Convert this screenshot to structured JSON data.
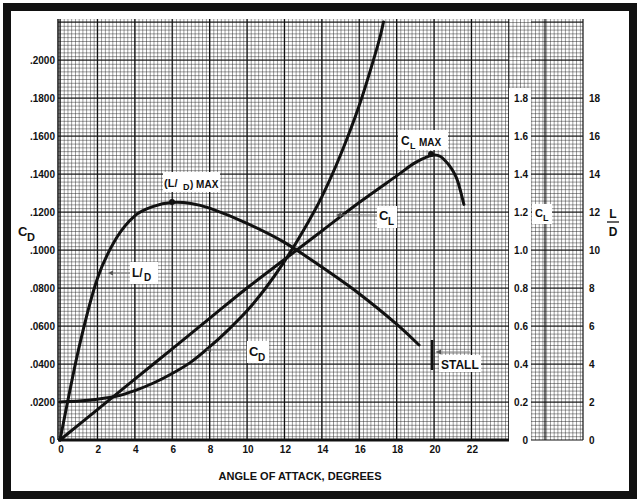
{
  "chart_data": {
    "type": "line",
    "title": "",
    "xlabel": "ANGLE OF ATTACK, DEGREES",
    "x_ticks": [
      "0",
      "2",
      "4",
      "6",
      "8",
      "10",
      "12",
      "14",
      "16",
      "18",
      "20",
      "22"
    ],
    "xlim": [
      0,
      24
    ],
    "grid": true,
    "axes": [
      {
        "id": "CD",
        "label": "C_D",
        "position": "left",
        "range": [
          0,
          0.22
        ],
        "ticks": [
          "0",
          ".0200",
          ".0400",
          ".0600",
          ".0800",
          ".1000",
          ".1200",
          ".1400",
          ".1600",
          ".1800",
          ".2000"
        ]
      },
      {
        "id": "CL",
        "label": "C_L",
        "position": "right-inner",
        "range": [
          0,
          1.8
        ],
        "ticks": [
          "0",
          "0.2",
          "0.4",
          "0.6",
          "0.8",
          "1.0",
          "1.2",
          "1.4",
          "1.6",
          "1.8"
        ]
      },
      {
        "id": "LD",
        "label": "L/D",
        "position": "right-outer",
        "range": [
          0,
          18
        ],
        "ticks": [
          "0",
          "2",
          "4",
          "6",
          "8",
          "10",
          "12",
          "14",
          "16",
          "18"
        ]
      }
    ],
    "series": [
      {
        "name": "C_L",
        "axis": "CL",
        "x": [
          0,
          2,
          4,
          6,
          8,
          10,
          12,
          14,
          16,
          18,
          19,
          20,
          20.6,
          21.2,
          21.6
        ],
        "values": [
          0,
          0.16,
          0.32,
          0.48,
          0.64,
          0.8,
          0.95,
          1.1,
          1.25,
          1.39,
          1.46,
          1.5,
          1.47,
          1.38,
          1.24
        ]
      },
      {
        "name": "L/D",
        "axis": "LD",
        "x": [
          0,
          1,
          2,
          3,
          4,
          5,
          6,
          7,
          8,
          10,
          12,
          14,
          16,
          18,
          19.2
        ],
        "values": [
          0,
          4.8,
          8.5,
          10.6,
          11.8,
          12.3,
          12.5,
          12.45,
          12.2,
          11.4,
          10.4,
          9.1,
          7.7,
          6.1,
          5.0
        ]
      },
      {
        "name": "C_D",
        "axis": "CD",
        "x": [
          0,
          1,
          2,
          3,
          4,
          5,
          6,
          7,
          8,
          9,
          10,
          11,
          12,
          13,
          14,
          15,
          16,
          17,
          17.3
        ],
        "values": [
          0.02,
          0.0205,
          0.0215,
          0.023,
          0.026,
          0.03,
          0.035,
          0.041,
          0.049,
          0.058,
          0.068,
          0.08,
          0.094,
          0.11,
          0.128,
          0.15,
          0.176,
          0.208,
          0.22
        ]
      }
    ],
    "annotations": [
      {
        "text": "(L/D) MAX",
        "x": 6,
        "value_LD": 12.5
      },
      {
        "text": "C_L MAX",
        "x": 20,
        "value_CL": 1.5
      },
      {
        "text": "STALL",
        "x": 19.8
      },
      {
        "text": "L/D",
        "points_to": "L/D curve"
      },
      {
        "text": "C_L",
        "points_to": "C_L curve"
      },
      {
        "text": "C_D",
        "points_to": "C_D curve"
      }
    ]
  },
  "labels": {
    "xlabel": "ANGLE OF ATTACK, DEGREES",
    "cd_axis": "C",
    "cd_sub": "D",
    "cl_axis": "C",
    "cl_sub": "L",
    "ld_num": "L",
    "ld_den": "D",
    "ld_max_open": "(L/",
    "ld_max_sub": "D",
    "ld_max_close": ") MAX",
    "cl_max_main": "C",
    "cl_max_sub": "L",
    "cl_max_word": "MAX",
    "stall": "STALL",
    "ld_tag_main": "L/",
    "ld_tag_sub": "D",
    "cl_tag_main": "C",
    "cl_tag_sub": "L",
    "cd_tag_main": "C",
    "cd_tag_sub": "D"
  }
}
